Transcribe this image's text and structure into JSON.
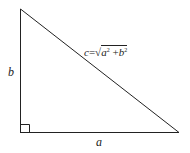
{
  "diagram": {
    "type": "right-triangle",
    "title": "",
    "labels": {
      "vertical_side": "b",
      "horizontal_side": "a",
      "hypotenuse_var": "c",
      "equals": "=",
      "sqrt_symbol": "√",
      "term1_base": "a",
      "term1_exp": "2",
      "plus": " +",
      "term2_base": "b",
      "term2_exp": "2"
    },
    "right_angle_marker": true,
    "colors": {
      "stroke": "#222222",
      "background": "#ffffff"
    }
  }
}
